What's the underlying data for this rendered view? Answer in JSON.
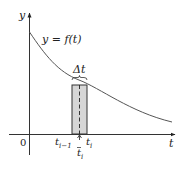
{
  "diagram": {
    "type": "riemann-sum-rectangle",
    "axes": {
      "y_label": "y",
      "x_label": "t",
      "origin_label": "0"
    },
    "curve": {
      "label_prefix": "y = ",
      "label_func": "f",
      "label_arg": "(t)",
      "description": "decreasing convex curve"
    },
    "rectangle": {
      "width_label": "Δt",
      "left_label_base": "t",
      "left_label_sub": "i−1",
      "right_label_base": "t",
      "right_label_sub": "i",
      "sample_label_base": "t",
      "sample_label_sub": "i",
      "sample_has_bar": true,
      "fill_color": "#d6d6d6"
    },
    "colors": {
      "axis": "#333333",
      "curve": "#555555",
      "rect_stroke": "#333333"
    }
  }
}
